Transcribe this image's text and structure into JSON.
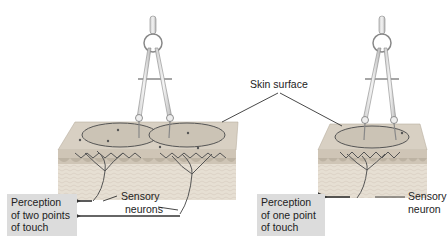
{
  "diagram": {
    "labels": {
      "skin_surface": "Skin surface",
      "sensory_neurons": "Sensory neurons",
      "sensory_neuron": "Sensory neuron"
    },
    "left_panel": {
      "caption_line1": "Perception",
      "caption_line2": "of two points",
      "caption_line3": "of touch",
      "neuron_label_line1": "Sensory",
      "neuron_label_line2": "neurons",
      "receptive_fields": 2
    },
    "right_panel": {
      "caption_line1": "Perception",
      "caption_line2": "of one point",
      "caption_line3": "of touch",
      "neuron_label_line1": "Sensory",
      "neuron_label_line2": "neuron",
      "receptive_fields": 1
    },
    "colors": {
      "skin_top": "#d9d2c6",
      "skin_side": "#cfc6b8",
      "dermis": "#e4dccf",
      "caption_box": "#dcdcdc",
      "neuron": "#555555",
      "arrow": "#333333"
    }
  }
}
